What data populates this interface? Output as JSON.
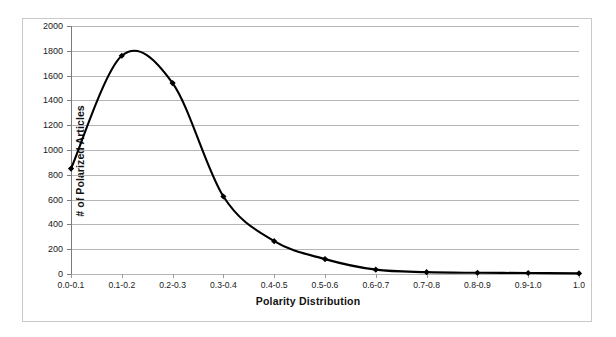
{
  "chart_data": {
    "type": "line",
    "title": "",
    "xlabel": "Polarity Distribution",
    "ylabel": "# of Polarized Articles",
    "categories": [
      "0.0-0.1",
      "0.1-0.2",
      "0.2-0.3",
      "0.3-0.4",
      "0.4-0.5",
      "0.5-0.6",
      "0.6-0.7",
      "0.7-0.8",
      "0.8-0.9",
      "0.9-1.0",
      "1.0"
    ],
    "values": [
      850,
      1760,
      1540,
      625,
      265,
      120,
      35,
      15,
      10,
      8,
      5
    ],
    "series": [
      {
        "name": "# of Polarized Articles",
        "values": [
          850,
          1760,
          1540,
          625,
          265,
          120,
          35,
          15,
          10,
          8,
          5
        ]
      }
    ],
    "ylim": [
      0,
      2000
    ],
    "y_ticks": [
      0,
      200,
      400,
      600,
      800,
      1000,
      1200,
      1400,
      1600,
      1800,
      2000
    ],
    "y_tick_labels": [
      "0",
      "200",
      "400",
      "600",
      "800",
      "1000",
      "1200",
      "1400",
      "1600",
      "1800",
      "2000"
    ],
    "grid": true,
    "legend": false,
    "legend_position": "none",
    "marker": "diamond",
    "line_color": "#000000",
    "marker_color": "#000000",
    "grid_color": "#b5b5b5",
    "smooth": true
  },
  "frame": {
    "border_color": "#c9c9c9",
    "background": "#ffffff"
  }
}
